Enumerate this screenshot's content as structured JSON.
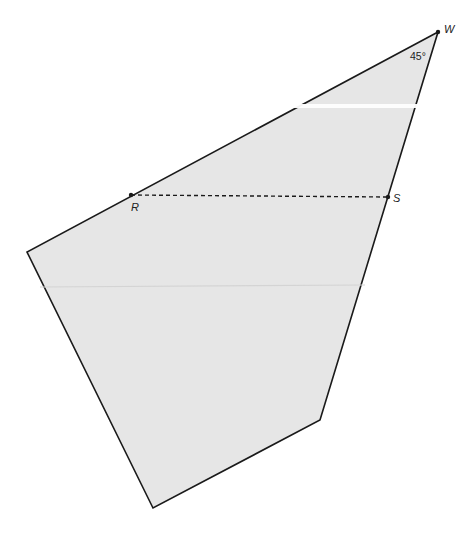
{
  "diagram": {
    "type": "geometry-figure",
    "shape": "quadrilateral",
    "fill_color": "#e6e6e6",
    "stroke_color": "#1a1a1a",
    "vertices": [
      {
        "id": "W",
        "label": "W",
        "x": 438,
        "y": 32
      },
      {
        "id": "left",
        "label": "",
        "x": 27,
        "y": 252
      },
      {
        "id": "bottom",
        "label": "",
        "x": 153,
        "y": 508
      },
      {
        "id": "lower-right",
        "label": "",
        "x": 320,
        "y": 420
      }
    ],
    "points": {
      "R": {
        "label": "R",
        "x": 131,
        "y": 195
      },
      "S": {
        "label": "S",
        "x": 388,
        "y": 197
      }
    },
    "segments": [
      {
        "from": "R",
        "to": "S",
        "style": "dashed"
      }
    ],
    "angle_label": "45°"
  }
}
